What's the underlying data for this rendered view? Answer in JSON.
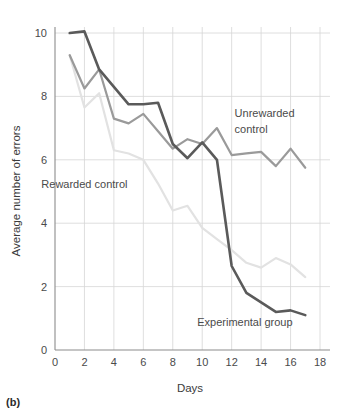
{
  "figure": {
    "panel_label": "(b)"
  },
  "chart_data": {
    "type": "line",
    "title": "",
    "xlabel": "Days",
    "ylabel": "Average number of errors",
    "xlim": [
      0,
      18
    ],
    "ylim": [
      0,
      10
    ],
    "xticks": [
      0,
      2,
      4,
      6,
      8,
      10,
      12,
      14,
      16,
      18
    ],
    "yticks": [
      0,
      2,
      4,
      6,
      8,
      10
    ],
    "grid": true,
    "legend_position": "inline-annotations",
    "series": [
      {
        "name": "Experimental group",
        "color": "#5a5a5a",
        "stroke_width": 2.6,
        "label_x": 12.9,
        "label_y": 0.75,
        "x": [
          1,
          2,
          3,
          4,
          5,
          6,
          7,
          8,
          9,
          10,
          11,
          12,
          13,
          14,
          15,
          16,
          17
        ],
        "values": [
          10.0,
          10.05,
          8.85,
          8.3,
          7.75,
          7.75,
          7.8,
          6.5,
          6.05,
          6.55,
          6.0,
          2.65,
          1.8,
          1.5,
          1.2,
          1.25,
          1.1
        ]
      },
      {
        "name": "Unrewarded control",
        "color": "#9a9a9a",
        "stroke_width": 2.2,
        "label_x": 12.2,
        "label_y": 7.35,
        "label_line2_y": 6.85,
        "label_line1": "Unrewarded",
        "label_line2": "control",
        "x": [
          1,
          2,
          3,
          4,
          5,
          6,
          7,
          8,
          9,
          10,
          11,
          12,
          13,
          14,
          15,
          16,
          17
        ],
        "values": [
          9.3,
          8.25,
          8.85,
          7.3,
          7.15,
          7.45,
          6.9,
          6.35,
          6.65,
          6.5,
          7.0,
          6.15,
          6.2,
          6.25,
          5.8,
          6.35,
          5.75
        ]
      },
      {
        "name": "Rewarded control",
        "color": "#e2e2e2",
        "stroke_width": 2.2,
        "label_x": 2.0,
        "label_y": 5.1,
        "x": [
          1,
          2,
          3,
          4,
          5,
          6,
          7,
          8,
          9,
          10,
          11,
          12,
          13,
          14,
          15,
          16,
          17
        ],
        "values": [
          9.3,
          7.65,
          8.1,
          6.3,
          6.2,
          6.0,
          5.25,
          4.4,
          4.55,
          3.85,
          3.5,
          3.15,
          2.75,
          2.6,
          2.9,
          2.7,
          2.3
        ]
      }
    ]
  }
}
